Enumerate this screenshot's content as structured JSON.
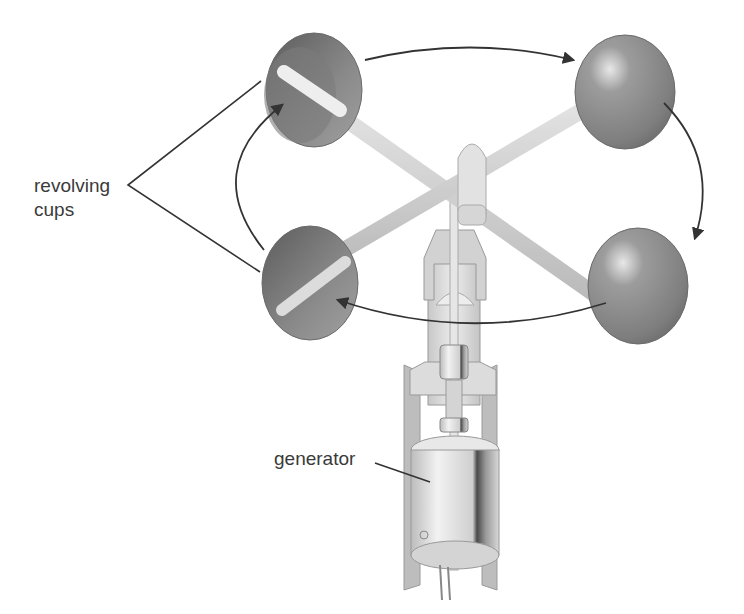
{
  "diagram": {
    "labels": {
      "cups_line1": "revolving",
      "cups_line2": "cups",
      "generator": "generator"
    },
    "components": [
      "revolving cups",
      "cross arms",
      "hub",
      "shaft",
      "housing",
      "coupling",
      "generator"
    ],
    "rotation": "clockwise (viewed from above)",
    "colors": {
      "cup": "#8a8a8a",
      "arm": "#e4e4e4",
      "housing": "#d6d6d6",
      "line": "#333333",
      "text": "#3a3a3a"
    }
  }
}
